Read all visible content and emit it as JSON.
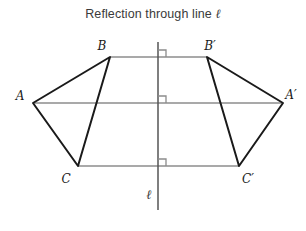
{
  "title": {
    "text_before": "Reflection through line ",
    "symbol": "ℓ",
    "full": "Reflection through line ℓ"
  },
  "colors": {
    "figure_stroke": "#1a1a1a",
    "connector_stroke": "#8c8c8c",
    "mirror_line_stroke": "#555555",
    "right_angle_stroke": "#8c8c8c",
    "title_text": "#3a3a3a",
    "background": "#ffffff"
  },
  "mirror_line": {
    "label": "ℓ",
    "label_x": 149,
    "label_y": 198,
    "x": 158,
    "y_top": 42,
    "y_bottom": 210
  },
  "points": [
    {
      "name": "A",
      "label": "A",
      "x": 33,
      "y": 103,
      "label_x": 20,
      "label_y": 100
    },
    {
      "name": "B",
      "label": "B",
      "x": 110,
      "y": 57,
      "label_x": 100,
      "label_y": 50
    },
    {
      "name": "C",
      "label": "C",
      "x": 78,
      "y": 166,
      "label_x": 64,
      "label_y": 182
    },
    {
      "name": "A'",
      "label": "A′",
      "x": 283,
      "y": 103,
      "label_x": 285,
      "label_y": 98
    },
    {
      "name": "B'",
      "label": "B′",
      "x": 207,
      "y": 57,
      "label_x": 207,
      "label_y": 50
    },
    {
      "name": "C'",
      "label": "C′",
      "x": 239,
      "y": 166,
      "label_x": 241,
      "label_y": 182
    }
  ],
  "triangles": [
    {
      "name": "pre-image-triangle",
      "vertices": [
        "A",
        "B",
        "C"
      ]
    },
    {
      "name": "image-triangle",
      "vertices": [
        "A'",
        "B'",
        "C'"
      ]
    }
  ],
  "connectors": [
    {
      "name": "connector-A-Aprime",
      "from": "A",
      "to": "A'",
      "x1": 33,
      "x2": 283,
      "y": 103
    },
    {
      "name": "connector-B-Bprime",
      "from": "B",
      "to": "B'",
      "x1": 110,
      "x2": 207,
      "y": 57
    },
    {
      "name": "connector-C-Cprime",
      "from": "C",
      "to": "C'",
      "x1": 78,
      "x2": 239,
      "y": 166
    }
  ],
  "right_angle_marks": [
    {
      "name": "right-angle-mark-top",
      "x": 158,
      "y": 57,
      "size": 7
    },
    {
      "name": "right-angle-mark-middle",
      "x": 158,
      "y": 103,
      "size": 7
    },
    {
      "name": "right-angle-mark-bottom",
      "x": 158,
      "y": 166,
      "size": 7
    }
  ]
}
